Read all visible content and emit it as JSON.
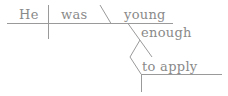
{
  "diagram": {
    "type": "sentence-diagram",
    "sentence": "He was young enough to apply",
    "words": {
      "subject": "He",
      "verb": "was",
      "predicate_adjective": "young",
      "modifier": "enough",
      "infinitive": "to apply"
    },
    "colors": {
      "lines": "#9a9a9a",
      "text": "#8a8a8a",
      "background": "#ffffff"
    }
  }
}
